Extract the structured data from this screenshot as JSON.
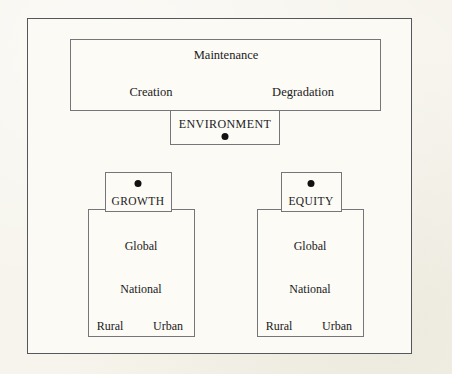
{
  "figure": {
    "background_color": "#f6f4ec",
    "frame_color": "#57565a",
    "box_border_color": "#76757a",
    "marker_color": "#111111"
  },
  "top_cluster": {
    "outer_box": {
      "title": "Maintenance",
      "left_label": "Creation",
      "right_label": "Degradation"
    },
    "label_box": {
      "title": "ENVIRONMENT",
      "marker": "bullet-dot"
    }
  },
  "lower_clusters": [
    {
      "label_box": {
        "title": "GROWTH",
        "marker": "bullet-dot"
      },
      "body_box": {
        "levels": [
          "Global",
          "National"
        ],
        "bottom_pair": [
          "Rural",
          "Urban"
        ]
      }
    },
    {
      "label_box": {
        "title": "EQUITY",
        "marker": "bullet-dot"
      },
      "body_box": {
        "levels": [
          "Global",
          "National"
        ],
        "bottom_pair": [
          "Rural",
          "Urban"
        ]
      }
    }
  ]
}
